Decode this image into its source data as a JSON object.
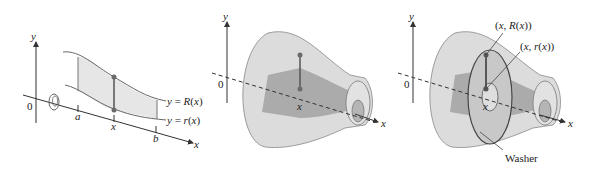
{
  "figure": {
    "panels": [
      {
        "id": "region",
        "labels": {
          "y_axis": "y",
          "origin": "0",
          "x_axis": "x",
          "a": "a",
          "x": "x",
          "b": "b",
          "upper_curve": "y = R(x)",
          "lower_curve": "y = r(x)"
        },
        "icons": [
          "rotation-arrow-icon"
        ]
      },
      {
        "id": "solid",
        "labels": {
          "y_axis": "y",
          "origin": "0",
          "x_axis": "x",
          "x": "x"
        }
      },
      {
        "id": "washer",
        "labels": {
          "y_axis": "y",
          "origin": "0",
          "x_axis": "x",
          "x": "x",
          "outer_point": "(x, R(x))",
          "inner_point": "(x, r(x))",
          "washer": "Washer"
        }
      }
    ],
    "colors": {
      "region_fill": "#e6e6e6",
      "solid_outer": "#d9d9d9",
      "solid_inner": "#a9a9a9",
      "point": "#6b6b6b",
      "axis": "#333333"
    }
  }
}
